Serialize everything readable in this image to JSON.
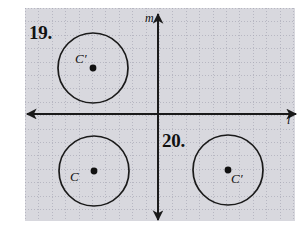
{
  "figure": {
    "kind": "geometry-reflection-exercise",
    "background": "#ffffff",
    "ink_color": "#111111",
    "grid_color": "#b9b9c4",
    "width": 308,
    "height": 229
  },
  "grid": {
    "visible": true,
    "style": "dotted",
    "spacing_px": 13.4,
    "left": 25,
    "top": 8,
    "width": 270,
    "height": 213
  },
  "axes": {
    "vertical": {
      "label": "m",
      "x": 158,
      "y_top": 14,
      "y_bottom": 220,
      "arrow_top": true,
      "arrow_bottom": true,
      "label_x": 145,
      "label_y": 12
    },
    "horizontal": {
      "label": "l",
      "y": 114,
      "x_left": 27,
      "x_right": 296,
      "arrow_left": true,
      "arrow_right": true,
      "label_x": 287,
      "label_y": 114
    }
  },
  "problems": [
    {
      "number": "19.",
      "x": 29,
      "y": 23
    },
    {
      "number": "20.",
      "x": 162,
      "y": 131
    }
  ],
  "circles": [
    {
      "id": "circle-top-left",
      "center_label": "C′",
      "cx": 93,
      "cy": 68,
      "r": 35,
      "label_x": 75,
      "label_y": 52,
      "quadrant": "upper-left",
      "belongs_to_problem": "19."
    },
    {
      "id": "circle-bottom-left",
      "center_label": "C",
      "cx": 94,
      "cy": 171,
      "r": 35,
      "label_x": 70,
      "label_y": 170,
      "quadrant": "lower-left",
      "belongs_to_problem": "19."
    },
    {
      "id": "circle-bottom-right",
      "center_label": "C′",
      "cx": 228,
      "cy": 170,
      "r": 35,
      "label_x": 231,
      "label_y": 172,
      "quadrant": "lower-right",
      "belongs_to_problem": "20."
    }
  ]
}
